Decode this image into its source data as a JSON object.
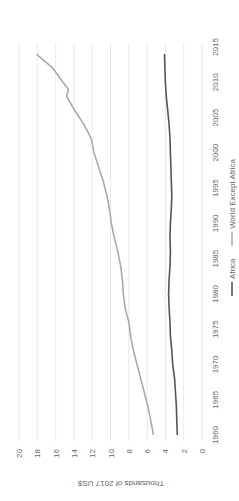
{
  "chart_data": {
    "type": "line",
    "orientation": "rotated-90-ccw",
    "title": "",
    "xlabel": "",
    "ylabel": "Thousands of 2017 US$",
    "ylim": [
      0,
      20
    ],
    "yticks": [
      0,
      2,
      4,
      6,
      8,
      10,
      12,
      14,
      16,
      18,
      20
    ],
    "xticks": [
      1960,
      1965,
      1970,
      1975,
      1980,
      1985,
      1990,
      1995,
      2000,
      2005,
      2010,
      2015
    ],
    "xlim": [
      1960,
      2015
    ],
    "grid": true,
    "legend_position": "bottom",
    "series": [
      {
        "name": "Africa",
        "color": "#555555",
        "x": [
          1960,
          1962,
          1964,
          1966,
          1968,
          1970,
          1972,
          1974,
          1976,
          1978,
          1980,
          1982,
          1984,
          1986,
          1988,
          1990,
          1992,
          1994,
          1996,
          1998,
          2000,
          2002,
          2004,
          2006,
          2008,
          2010,
          2012,
          2014
        ],
        "values": [
          2.7,
          2.75,
          2.8,
          2.9,
          3.0,
          3.2,
          3.3,
          3.45,
          3.5,
          3.6,
          3.65,
          3.6,
          3.5,
          3.45,
          3.5,
          3.45,
          3.35,
          3.3,
          3.35,
          3.4,
          3.45,
          3.5,
          3.6,
          3.75,
          3.9,
          4.0,
          4.05,
          4.1
        ]
      },
      {
        "name": "World Except Africa",
        "color": "#aaaaaa",
        "x": [
          1960,
          1962,
          1964,
          1966,
          1968,
          1970,
          1972,
          1974,
          1976,
          1978,
          1980,
          1982,
          1984,
          1986,
          1988,
          1990,
          1992,
          1994,
          1996,
          1998,
          2000,
          2002,
          2004,
          2006,
          2008,
          2009,
          2010,
          2012,
          2014
        ],
        "values": [
          5.3,
          5.6,
          5.9,
          6.3,
          6.7,
          7.1,
          7.5,
          7.8,
          8.0,
          8.4,
          8.6,
          8.7,
          8.9,
          9.2,
          9.6,
          9.9,
          10.1,
          10.4,
          10.8,
          11.3,
          11.8,
          12.1,
          12.9,
          13.9,
          14.8,
          14.6,
          15.2,
          16.3,
          18.1
        ]
      }
    ]
  },
  "legend": {
    "items": [
      {
        "label": "Africa",
        "color": "#555555"
      },
      {
        "label": "World Except Africa",
        "color": "#aaaaaa"
      }
    ]
  },
  "axis": {
    "y_title": "Thousands of 2017 US$",
    "y_ticks": [
      "0",
      "2",
      "4",
      "6",
      "8",
      "10",
      "12",
      "14",
      "16",
      "18",
      "20"
    ],
    "x_ticks": [
      "1960",
      "1965",
      "1970",
      "1975",
      "1980",
      "1985",
      "1990",
      "1995",
      "2000",
      "2005",
      "2010",
      "2015"
    ]
  }
}
